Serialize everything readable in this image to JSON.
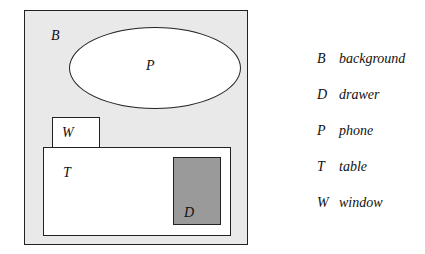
{
  "scene": {
    "background": {
      "label": "B"
    },
    "phone": {
      "label": "P"
    },
    "window": {
      "label": "W"
    },
    "table": {
      "label": "T"
    },
    "drawer": {
      "label": "D"
    }
  },
  "colors": {
    "background": "#e9e9e9",
    "drawer": "#9a9a9a",
    "outline": "#222222"
  },
  "legend": [
    {
      "letter": "B",
      "word": "background"
    },
    {
      "letter": "D",
      "word": "drawer"
    },
    {
      "letter": "P",
      "word": "phone"
    },
    {
      "letter": "T",
      "word": "table"
    },
    {
      "letter": "W",
      "word": "window"
    }
  ]
}
